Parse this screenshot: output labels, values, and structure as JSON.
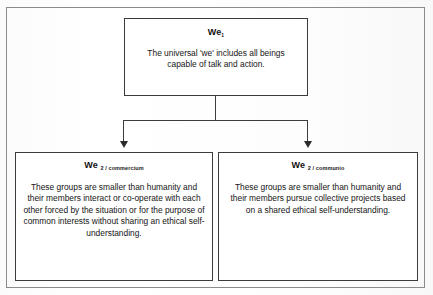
{
  "diagram": {
    "type": "tree",
    "frame": {
      "label": "outer-frame"
    },
    "nodes": [
      {
        "id": "we1",
        "title_main": "We",
        "title_sub": "1",
        "body": "The universal 'we' includes all beings capable of talk and action."
      },
      {
        "id": "we2_commercium",
        "title_main": "We",
        "title_sub": "2 / commercium",
        "body": "These groups are smaller than humanity and their members interact or co-operate with each other forced by the situation or for the purpose of common interests without sharing an ethical self-understanding."
      },
      {
        "id": "we2_communio",
        "title_main": "We",
        "title_sub": "2 / communio",
        "body": "These groups are smaller than humanity and their members pursue collective projects based on a shared ethical self-understanding."
      }
    ],
    "connectors": [
      {
        "id": "stem",
        "from": "we1",
        "kind": "vertical-line"
      },
      {
        "id": "bar",
        "kind": "horizontal-line"
      },
      {
        "id": "drop-left",
        "to": "we2_commercium",
        "kind": "arrow-down"
      },
      {
        "id": "drop-right",
        "to": "we2_communio",
        "kind": "arrow-down"
      }
    ],
    "colors": {
      "page_background": "#ffffff",
      "box_border": "#3b3b3b",
      "frame_border": "#8b8b8b",
      "connector": "#3d3d3d",
      "arrow_head": "#2b2b2b",
      "text": "#151515"
    }
  }
}
